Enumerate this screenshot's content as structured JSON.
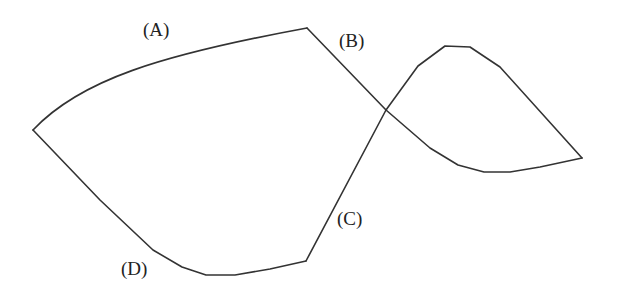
{
  "diagram": {
    "title": "",
    "stroke_color": "#333333",
    "background": "#ffffff",
    "labels": [
      {
        "id": "A",
        "text": "(A)",
        "x": 143,
        "y": 20
      },
      {
        "id": "B",
        "text": "(B)",
        "x": 339,
        "y": 31
      },
      {
        "id": "C",
        "text": "(C)",
        "x": 337,
        "y": 209
      },
      {
        "id": "D",
        "text": "(D)",
        "x": 121,
        "y": 259
      }
    ],
    "curves": [
      {
        "id": "curve-A",
        "description": "arc from left vertex to top vertex"
      },
      {
        "id": "curve-B",
        "description": "line from top vertex down through crossing to lower-right lobe and right tip"
      },
      {
        "id": "curve-C",
        "description": "line from bottom-right corner up through crossing to upper-right peak and right tip"
      },
      {
        "id": "curve-D",
        "description": "curve from left vertex down to bottom"
      }
    ]
  }
}
